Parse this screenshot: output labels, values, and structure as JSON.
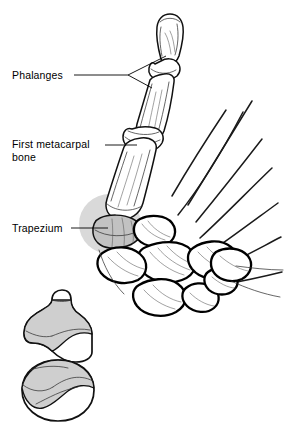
{
  "figure": {
    "kind": "anatomical-line-drawing",
    "background_color": "#ffffff",
    "ink_color": "#000000",
    "shade_color": "#c2c2c2",
    "highlight_color": "#d9d9d9",
    "width": 285,
    "height": 430
  },
  "labels": [
    {
      "id": "phalanges",
      "text": "Phalanges",
      "x": 12,
      "y": 79,
      "leader": "fork-two-branches",
      "points_to": "distal and proximal phalanges of the thumb"
    },
    {
      "id": "first-metacarpal-bone",
      "line1": "First metacarpal",
      "line2": "bone",
      "x": 12,
      "y": 148,
      "leader": "straight-horizontal",
      "points_to": "shaft of the first metacarpal"
    },
    {
      "id": "trapezium",
      "text": "Trapezium",
      "x": 12,
      "y": 232,
      "leader": "straight-horizontal",
      "points_to": "trapezium carpal bone, shaded"
    }
  ],
  "structures": {
    "distal_phalanx": "Distal phalanx of thumb",
    "proximal_phalanx": "Proximal phalanx of thumb",
    "interphalangeal_joint": "Interphalangeal joint",
    "metacarpophalangeal_joint": "Metacarpophalangeal joint",
    "first_metacarpal": "First metacarpal bone",
    "trapezium": "Trapezium",
    "carpal_cluster": "Remaining carpal bones",
    "metacarpal_rays": "Second through fifth metacarpals"
  },
  "inset": {
    "id": "saddle-joint-inset",
    "title": "",
    "upper": {
      "id": "metacarpal-base",
      "name": "Base of first metacarpal — saddle surface",
      "shading": "#cfcfcf"
    },
    "lower": {
      "id": "trapezium-surface",
      "name": "Trapezium — reciprocal saddle surface",
      "shading": "#cfcfcf"
    }
  }
}
